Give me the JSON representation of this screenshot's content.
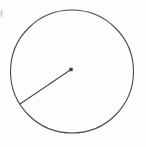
{
  "figure": {
    "kind": "geometry-diagram",
    "title": "Circle with a radius drawn from the center",
    "background_color": "#fdfdfd",
    "width": 146,
    "height": 147,
    "stroke_color": "#4a4a4a",
    "dot_color": "#3b3b3b",
    "artifact_color": "#cfcfcf"
  },
  "shapes": {
    "circle": {
      "label": "circle",
      "center_x": 72,
      "center_y": 71.5,
      "radius": 61.5,
      "stroke_width": 1.1,
      "fill": "none"
    },
    "center_point": {
      "label": "center point",
      "x": 71,
      "y": 69.5,
      "size": 3.4
    },
    "radius_segment": {
      "label": "radius",
      "x1": 71,
      "y1": 69.5,
      "x2": 20,
      "y2": 104,
      "stroke_width": 1.1
    },
    "edge_artifact": {
      "label": "edge smudge",
      "x": 0.5,
      "y": 10,
      "width": 2,
      "height": 7
    }
  }
}
